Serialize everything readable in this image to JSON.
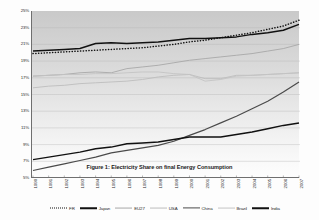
{
  "chart_data": {
    "type": "line",
    "title": "Figure 1: Electricity Share on final Energy Consumption",
    "xlabel": "",
    "ylabel": "",
    "grid": true,
    "legend_position": "bottom",
    "ylim": [
      5,
      25
    ],
    "yticks": [
      "5%",
      "7%",
      "9%",
      "11%",
      "13%",
      "15%",
      "17%",
      "19%",
      "21%",
      "23%",
      "25%"
    ],
    "ytick_values": [
      5,
      7,
      9,
      11,
      13,
      15,
      17,
      19,
      21,
      23,
      25
    ],
    "categories": [
      "1990",
      "1991",
      "1992",
      "1993",
      "1994",
      "1995",
      "1996",
      "1997",
      "1998",
      "1999",
      "2000",
      "2001",
      "2002",
      "2003",
      "2004",
      "2005",
      "2006",
      "2007"
    ],
    "x": [
      1990,
      1991,
      1992,
      1993,
      1994,
      1995,
      1996,
      1997,
      1998,
      1999,
      2000,
      2001,
      2002,
      2003,
      2004,
      2005,
      2006,
      2007
    ],
    "series": [
      {
        "name": "FR",
        "style": "dotted",
        "color": "#111111",
        "values": [
          19.9,
          20.0,
          20.1,
          20.2,
          20.3,
          20.4,
          20.5,
          20.6,
          20.8,
          21.0,
          21.3,
          21.5,
          21.8,
          22.1,
          22.4,
          22.8,
          23.2,
          23.9
        ]
      },
      {
        "name": "Japan",
        "style": "solid-thick",
        "color": "#111111",
        "values": [
          20.2,
          20.3,
          20.4,
          20.5,
          21.1,
          21.2,
          21.1,
          21.2,
          21.3,
          21.5,
          21.7,
          21.7,
          21.8,
          21.9,
          22.2,
          22.4,
          22.7,
          23.4
        ]
      },
      {
        "name": "EU27",
        "style": "solid-light",
        "color": "#a8a8a8",
        "values": [
          17.2,
          17.3,
          17.4,
          17.6,
          17.7,
          17.6,
          18.1,
          18.3,
          18.5,
          18.8,
          19.1,
          19.3,
          19.5,
          19.7,
          19.9,
          20.2,
          20.5,
          21.0
        ]
      },
      {
        "name": "USA",
        "style": "solid-light",
        "color": "#bdbdbd",
        "values": [
          15.8,
          16.0,
          16.1,
          16.3,
          16.4,
          16.5,
          16.6,
          16.8,
          17.1,
          17.3,
          17.4,
          16.9,
          16.9,
          17.3,
          17.3,
          17.4,
          17.5,
          17.6
        ]
      },
      {
        "name": "China",
        "style": "solid-dark",
        "color": "#4a4a4a",
        "values": [
          5.9,
          6.3,
          6.7,
          7.1,
          7.5,
          8.0,
          8.3,
          8.6,
          8.9,
          9.4,
          10.1,
          10.8,
          11.6,
          12.4,
          13.3,
          14.2,
          15.3,
          16.5
        ]
      },
      {
        "name": "Brazil",
        "style": "solid-light",
        "color": "#c4c4c4",
        "values": [
          17.2,
          17.3,
          17.4,
          17.4,
          17.5,
          17.5,
          17.6,
          17.7,
          17.7,
          17.5,
          17.4,
          16.6,
          16.8,
          17.2,
          17.3,
          17.4,
          17.5,
          17.6
        ]
      },
      {
        "name": "India",
        "style": "solid-thick",
        "color": "#111111",
        "values": [
          7.2,
          7.5,
          7.8,
          8.1,
          8.5,
          8.7,
          9.1,
          9.2,
          9.3,
          9.6,
          9.9,
          9.9,
          9.9,
          10.2,
          10.5,
          10.9,
          11.3,
          11.6
        ]
      }
    ]
  },
  "legend": {
    "items": [
      {
        "label": "FR",
        "style": "dotted",
        "color": "#111111"
      },
      {
        "label": "Japan",
        "style": "solid-thick",
        "color": "#111111"
      },
      {
        "label": "EU27",
        "style": "solid-light",
        "color": "#a8a8a8"
      },
      {
        "label": "USA",
        "style": "solid-light",
        "color": "#bdbdbd"
      },
      {
        "label": "China",
        "style": "solid-dark",
        "color": "#4a4a4a"
      },
      {
        "label": "Brazil",
        "style": "solid-light",
        "color": "#c4c4c4"
      },
      {
        "label": "India",
        "style": "solid-thick",
        "color": "#111111"
      }
    ]
  }
}
